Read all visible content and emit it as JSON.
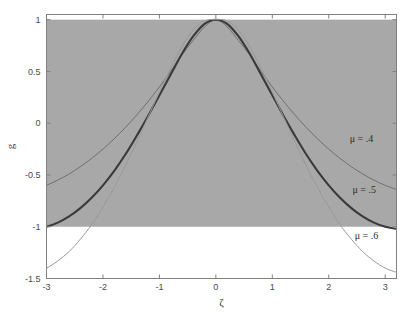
{
  "chart_data": {
    "type": "line",
    "title": "",
    "xlabel": "ζ",
    "ylabel": "g",
    "xlim": [
      -3.0,
      3.2
    ],
    "ylim": [
      -1.5,
      1.05
    ],
    "xticks": [
      -3,
      -2,
      -1,
      0,
      1,
      2,
      3
    ],
    "xtick_labels": [
      "-3",
      "-2",
      "-1",
      "0",
      "1",
      "2",
      "3"
    ],
    "yticks": [
      -1.5,
      -1,
      -0.5,
      0,
      0.5,
      1
    ],
    "ytick_labels": [
      "-1.5",
      "-1",
      "-0.5",
      "0",
      "0.5",
      "1"
    ],
    "grid": false,
    "legend_position": "inline-annotations",
    "shaded_band": {
      "label": "shaded region",
      "y_from": -1,
      "y_to": 1,
      "color": "#a8a8a8"
    },
    "x": [
      -3.2,
      -3.0,
      -2.8,
      -2.6,
      -2.4,
      -2.2,
      -2.0,
      -1.8,
      -1.6,
      -1.4,
      -1.2,
      -1.0,
      -0.8,
      -0.6,
      -0.4,
      -0.2,
      0.0,
      0.2,
      0.4,
      0.6,
      0.8,
      1.0,
      1.2,
      1.4,
      1.6,
      1.8,
      2.0,
      2.2,
      2.4,
      2.6,
      2.8,
      3.0,
      3.2
    ],
    "series": [
      {
        "name": "μ = .4",
        "color": "#6f6f6f",
        "width": 1.0,
        "values": [
          -0.64,
          -0.6,
          -0.55,
          -0.49,
          -0.42,
          -0.34,
          -0.25,
          -0.15,
          -0.04,
          0.08,
          0.21,
          0.35,
          0.5,
          0.66,
          0.8,
          0.93,
          1.0,
          0.93,
          0.8,
          0.66,
          0.5,
          0.35,
          0.21,
          0.08,
          -0.04,
          -0.15,
          -0.25,
          -0.34,
          -0.42,
          -0.49,
          -0.55,
          -0.6,
          -0.64
        ]
      },
      {
        "name": "μ = .5",
        "color": "#3a3a3a",
        "width": 2.1,
        "values": [
          -1.02,
          -1.0,
          -0.96,
          -0.9,
          -0.82,
          -0.72,
          -0.6,
          -0.46,
          -0.3,
          -0.12,
          0.07,
          0.27,
          0.47,
          0.67,
          0.84,
          0.96,
          1.0,
          0.96,
          0.84,
          0.67,
          0.47,
          0.27,
          0.07,
          -0.12,
          -0.3,
          -0.46,
          -0.6,
          -0.72,
          -0.82,
          -0.9,
          -0.96,
          -1.0,
          -1.02
        ]
      },
      {
        "name": "μ = .6",
        "color": "#9a9a9a",
        "width": 1.0,
        "values": [
          -1.44,
          -1.4,
          -1.33,
          -1.24,
          -1.12,
          -0.98,
          -0.81,
          -0.62,
          -0.41,
          -0.18,
          0.06,
          0.3,
          0.53,
          0.74,
          0.9,
          0.99,
          1.0,
          0.99,
          0.9,
          0.74,
          0.53,
          0.3,
          0.06,
          -0.18,
          -0.41,
          -0.62,
          -0.81,
          -0.98,
          -1.12,
          -1.24,
          -1.33,
          -1.4,
          -1.44
        ]
      }
    ],
    "annotations": [
      {
        "text": "μ = .4",
        "x": 2.37,
        "y": -0.18
      },
      {
        "text": "μ = .5",
        "x": 2.42,
        "y": -0.67
      },
      {
        "text": "μ = .6",
        "x": 2.46,
        "y": -1.12
      }
    ]
  },
  "axis_colors": {
    "frame": "#808080",
    "tick": "#808080",
    "band": "#a8a8a8",
    "background": "#ffffff"
  }
}
